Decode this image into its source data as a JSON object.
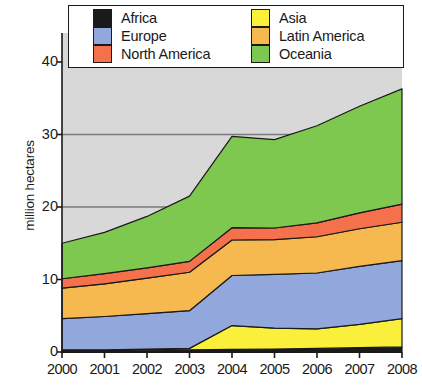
{
  "chart_data": {
    "type": "area",
    "stacked": true,
    "title": "",
    "xlabel": "",
    "ylabel": "million hectares",
    "x": [
      2000,
      2001,
      2002,
      2003,
      2004,
      2005,
      2006,
      2007,
      2008
    ],
    "categories": [
      "2000",
      "2001",
      "2002",
      "2003",
      "2004",
      "2005",
      "2006",
      "2007",
      "2008"
    ],
    "xlim": [
      2000,
      2008
    ],
    "ylim": [
      0,
      44
    ],
    "yticks": [
      0,
      10,
      20,
      30,
      40
    ],
    "ytick_labels": [
      "0",
      "10",
      "20",
      "30",
      "40"
    ],
    "xtick_labels": [
      "2000",
      "2001",
      "2002",
      "2003",
      "2004",
      "2005",
      "2006",
      "2007",
      "2008"
    ],
    "grid": "horizontal",
    "gridlines": [
      20,
      30
    ],
    "legend_position": "top",
    "legend_columns": 2,
    "plot_background": "#d8d8d8",
    "series": [
      {
        "name": "Africa",
        "color": "#1a1a1a",
        "values": [
          0.2,
          0.2,
          0.25,
          0.3,
          0.35,
          0.4,
          0.5,
          0.6,
          0.7
        ]
      },
      {
        "name": "Asia",
        "color": "#FAF03C",
        "values": [
          0.1,
          0.1,
          0.15,
          0.2,
          3.3,
          2.9,
          2.7,
          3.2,
          3.9
        ]
      },
      {
        "name": "Europe",
        "color": "#92A8DC",
        "values": [
          4.3,
          4.6,
          4.9,
          5.2,
          6.9,
          7.4,
          7.7,
          8.0,
          8.0
        ]
      },
      {
        "name": "Latin America",
        "color": "#F5B94F",
        "values": [
          4.2,
          4.5,
          4.9,
          5.3,
          4.9,
          4.8,
          5.0,
          5.2,
          5.3
        ]
      },
      {
        "name": "North America",
        "color": "#F4714B",
        "values": [
          1.3,
          1.4,
          1.4,
          1.5,
          1.7,
          1.6,
          1.9,
          2.2,
          2.5
        ]
      },
      {
        "name": "Oceania",
        "color": "#7EC850",
        "values": [
          4.9,
          5.7,
          7.1,
          9.0,
          12.6,
          12.2,
          13.4,
          14.7,
          15.9
        ]
      }
    ],
    "totals": [
      15.0,
      16.5,
      18.7,
      21.5,
      29.75,
      29.3,
      31.2,
      33.9,
      36.3
    ],
    "legend_entries": [
      {
        "label": "Africa",
        "color": "#1a1a1a"
      },
      {
        "label": "Asia",
        "color": "#FAF03C"
      },
      {
        "label": "Europe",
        "color": "#92A8DC"
      },
      {
        "label": "Latin America",
        "color": "#F5B94F"
      },
      {
        "label": "North America",
        "color": "#F4714B"
      },
      {
        "label": "Oceania",
        "color": "#7EC850"
      }
    ],
    "legend_left_column": [
      {
        "label": "Africa",
        "color": "#1a1a1a"
      },
      {
        "label": "Europe",
        "color": "#92A8DC"
      },
      {
        "label": "North America",
        "color": "#F4714B"
      }
    ],
    "legend_right_column": [
      {
        "label": "Asia",
        "color": "#FAF03C"
      },
      {
        "label": "Latin America",
        "color": "#F5B94F"
      },
      {
        "label": "Oceania",
        "color": "#7EC850"
      }
    ]
  }
}
